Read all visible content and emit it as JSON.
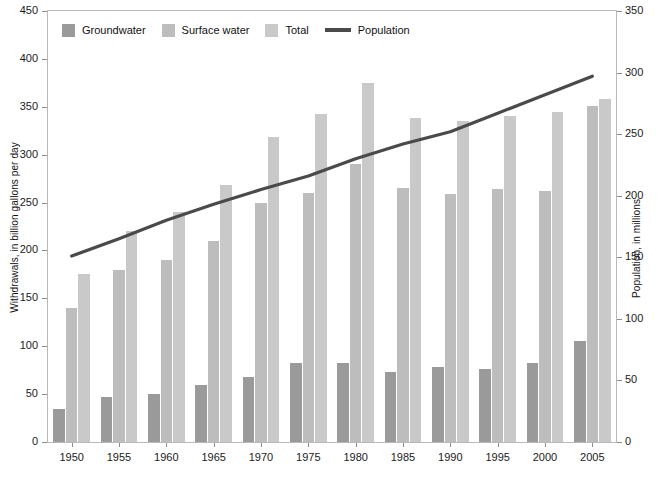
{
  "chart_data": {
    "type": "bar",
    "title": "",
    "xlabel": "",
    "ylabel": "Withdrawals, in billion gallons per day",
    "y2label": "Population, in millions",
    "categories": [
      "1950",
      "1955",
      "1960",
      "1965",
      "1970",
      "1975",
      "1980",
      "1985",
      "1990",
      "1995",
      "2000",
      "2005"
    ],
    "ylim": [
      0,
      450
    ],
    "y2lim": [
      0,
      350
    ],
    "yticks": [
      0,
      50,
      100,
      150,
      200,
      250,
      300,
      350,
      400,
      450
    ],
    "y2ticks": [
      0,
      50,
      100,
      150,
      200,
      250,
      300,
      350
    ],
    "grid": false,
    "legend_position": "top-left",
    "series": [
      {
        "name": "Groundwater",
        "kind": "bar",
        "color": "#9a9a9a",
        "axis": "left",
        "values": [
          34,
          47,
          50,
          60,
          68,
          83,
          83,
          73,
          78,
          76,
          83,
          105
        ]
      },
      {
        "name": "Surface water",
        "kind": "bar",
        "color": "#bdbdbd",
        "axis": "left",
        "values": [
          140,
          180,
          190,
          210,
          250,
          260,
          290,
          265,
          259,
          264,
          262,
          351
        ]
      },
      {
        "name": "Total",
        "kind": "bar",
        "color": "#c9c9c9",
        "axis": "left",
        "values": [
          175,
          220,
          240,
          268,
          318,
          342,
          375,
          338,
          335,
          340,
          345,
          358
        ]
      },
      {
        "name": "Population",
        "kind": "line",
        "color": "#4a4a4a",
        "axis": "right",
        "values": [
          151,
          165,
          180,
          193,
          205,
          216,
          230,
          242,
          252,
          267,
          282,
          297
        ]
      }
    ]
  },
  "legend": {
    "items": [
      {
        "label": "Groundwater",
        "marker": "swatch",
        "color": "#9a9a9a"
      },
      {
        "label": "Surface water",
        "marker": "swatch",
        "color": "#bdbdbd"
      },
      {
        "label": "Total",
        "marker": "swatch",
        "color": "#c9c9c9"
      },
      {
        "label": "Population",
        "marker": "line",
        "color": "#4a4a4a"
      }
    ]
  },
  "axes": {
    "left_title": "Withdrawals, in billion gallons per day",
    "right_title": "Population, in millions",
    "left_ticks": [
      "450",
      "400",
      "350",
      "300",
      "250",
      "200",
      "150",
      "100",
      "50",
      "0"
    ],
    "right_ticks": [
      "350",
      "300",
      "250",
      "200",
      "150",
      "100",
      "50",
      "0"
    ],
    "x_ticks": [
      "1950",
      "1955",
      "1960",
      "1965",
      "1970",
      "1975",
      "1980",
      "1985",
      "1990",
      "1995",
      "2000",
      "2005"
    ]
  }
}
